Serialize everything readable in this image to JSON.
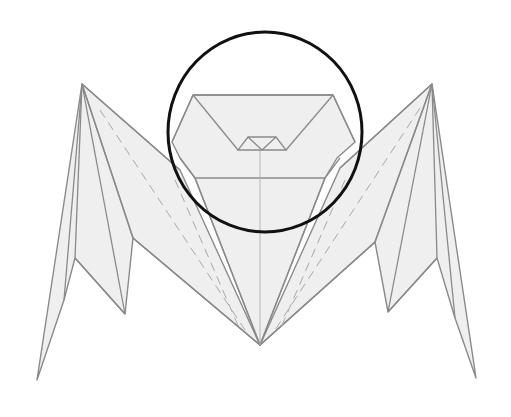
{
  "figure": {
    "highlight": {
      "shape": "circle",
      "cx": 265,
      "cy": 132,
      "rx": 97,
      "ry": 100,
      "color": "#111111"
    },
    "colors": {
      "paper": "#efefef",
      "line": "#8a8a8a",
      "background": "#ffffff"
    }
  }
}
